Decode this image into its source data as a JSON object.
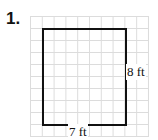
{
  "problem": {
    "number_label": "1.",
    "shape": "rectangle",
    "height_label": "8 ft",
    "width_label": "7 ft",
    "height_units": 8,
    "width_units": 7,
    "colors": {
      "outline": "#111111",
      "grid": "#dcdcdc",
      "background": "#ffffff"
    }
  }
}
